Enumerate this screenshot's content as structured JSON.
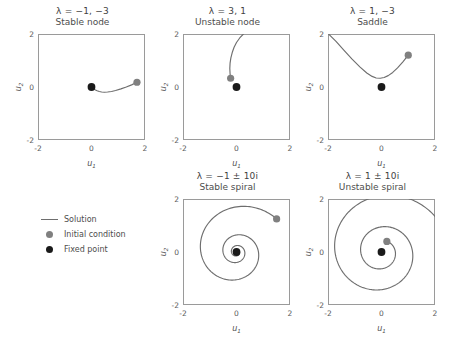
{
  "figure": {
    "axis_ticks": [
      "-2",
      "0",
      "2"
    ],
    "xlabel": "u",
    "xlabel_sub": "1",
    "ylabel": "u",
    "ylabel_sub": "2",
    "line_color": "#6e6e6e",
    "initial_condition_color": "#808080",
    "fixed_point_color": "#1a1a1a",
    "frame_color": "#9a9a9a"
  },
  "legend": {
    "items": [
      {
        "label": "Solution",
        "marker": "line"
      },
      {
        "label": "Initial condition",
        "marker": "gray-dot"
      },
      {
        "label": "Fixed point",
        "marker": "black-dot"
      }
    ]
  },
  "chart_data": {
    "type": "line",
    "xlabel": "u1",
    "ylabel": "u2",
    "xlim": [
      -2,
      2
    ],
    "ylim": [
      -2,
      2
    ],
    "grid": false,
    "legend_position": "middle-left",
    "panels": [
      {
        "id": "stable-node",
        "eigenvalues_label": "λ = −1,  −3",
        "classification": "Stable node",
        "fixed_point": [
          0,
          0
        ],
        "initial_condition": [
          1.7,
          0.18
        ],
        "trajectory": [
          [
            1.7,
            0.18
          ],
          [
            1.5,
            0.08
          ],
          [
            1.3,
            0.0
          ],
          [
            1.1,
            -0.07
          ],
          [
            0.9,
            -0.13
          ],
          [
            0.75,
            -0.17
          ],
          [
            0.6,
            -0.19
          ],
          [
            0.48,
            -0.2
          ],
          [
            0.38,
            -0.19
          ],
          [
            0.29,
            -0.17
          ],
          [
            0.21,
            -0.14
          ],
          [
            0.15,
            -0.11
          ],
          [
            0.1,
            -0.08
          ],
          [
            0.06,
            -0.05
          ],
          [
            0.03,
            -0.03
          ],
          [
            0.0,
            0.0
          ]
        ]
      },
      {
        "id": "unstable-node",
        "eigenvalues_label": "λ = 3, 1",
        "classification": "Unstable node",
        "fixed_point": [
          0,
          0
        ],
        "initial_condition": [
          -0.22,
          0.33
        ],
        "trajectory": [
          [
            -0.22,
            0.33
          ],
          [
            -0.24,
            0.5
          ],
          [
            -0.25,
            0.7
          ],
          [
            -0.24,
            0.9
          ],
          [
            -0.21,
            1.1
          ],
          [
            -0.16,
            1.3
          ],
          [
            -0.09,
            1.5
          ],
          [
            0.0,
            1.68
          ],
          [
            0.12,
            1.85
          ],
          [
            0.26,
            2.0
          ],
          [
            0.4,
            2.14
          ]
        ]
      },
      {
        "id": "saddle",
        "eigenvalues_label": "λ = 1,  −3",
        "classification": "Saddle",
        "fixed_point": [
          0,
          0
        ],
        "initial_condition": [
          1.0,
          1.2
        ],
        "trajectory": [
          [
            1.0,
            1.2
          ],
          [
            0.8,
            0.95
          ],
          [
            0.6,
            0.72
          ],
          [
            0.42,
            0.55
          ],
          [
            0.25,
            0.43
          ],
          [
            0.1,
            0.36
          ],
          [
            -0.05,
            0.33
          ],
          [
            -0.2,
            0.34
          ],
          [
            -0.35,
            0.4
          ],
          [
            -0.55,
            0.53
          ],
          [
            -0.8,
            0.75
          ],
          [
            -1.1,
            1.05
          ],
          [
            -1.4,
            1.38
          ],
          [
            -1.7,
            1.72
          ],
          [
            -2.0,
            2.02
          ]
        ]
      },
      {
        "id": "stable-spiral",
        "eigenvalues_label": "λ =  −1 ± 10i",
        "classification": "Stable spiral",
        "fixed_point": [
          0,
          0
        ],
        "initial_condition": [
          1.5,
          1.25
        ],
        "spiral": {
          "direction": "inward",
          "start_radius": 1.95,
          "start_angle_deg": 40,
          "turns": 3.05,
          "decay": 0.1,
          "rotation": "clockwise"
        }
      },
      {
        "id": "unstable-spiral",
        "eigenvalues_label": "λ = 1 ± 10i",
        "classification": "Unstable spiral",
        "fixed_point": [
          0,
          0
        ],
        "initial_condition": [
          0.2,
          0.4
        ],
        "spiral": {
          "direction": "outward",
          "start_radius": 0.45,
          "start_angle_deg": 63,
          "turns": 2.15,
          "decay": 0.1,
          "rotation": "clockwise"
        }
      }
    ]
  }
}
